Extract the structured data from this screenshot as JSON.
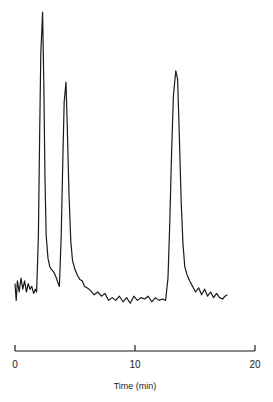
{
  "chart_data": {
    "type": "line",
    "title": "",
    "xlabel": "Time (min)",
    "ylabel": "",
    "xlim": [
      0,
      20
    ],
    "xticks": [
      0,
      10,
      20
    ],
    "grid": false,
    "legend": null,
    "line_color": "#1a1a1a",
    "peaks": [
      {
        "time": 2.3,
        "relative_height": 1.0
      },
      {
        "time": 4.25,
        "relative_height": 0.75
      },
      {
        "time": 13.5,
        "relative_height": 0.79
      }
    ],
    "trace": [
      [
        0.0,
        0.03
      ],
      [
        0.1,
        -0.03
      ],
      [
        0.2,
        0.04
      ],
      [
        0.35,
        0.0
      ],
      [
        0.5,
        0.05
      ],
      [
        0.65,
        0.01
      ],
      [
        0.8,
        0.04
      ],
      [
        0.95,
        0.0
      ],
      [
        1.1,
        0.03
      ],
      [
        1.25,
        0.01
      ],
      [
        1.4,
        0.02
      ],
      [
        1.55,
        -0.005
      ],
      [
        1.7,
        0.01
      ],
      [
        1.8,
        0.0
      ],
      [
        1.95,
        0.2
      ],
      [
        2.05,
        0.55
      ],
      [
        2.15,
        0.85
      ],
      [
        2.3,
        1.0
      ],
      [
        2.4,
        0.75
      ],
      [
        2.5,
        0.4
      ],
      [
        2.6,
        0.2
      ],
      [
        2.75,
        0.12
      ],
      [
        2.9,
        0.09
      ],
      [
        3.05,
        0.08
      ],
      [
        3.25,
        0.07
      ],
      [
        3.45,
        0.05
      ],
      [
        3.6,
        0.03
      ],
      [
        3.7,
        0.02
      ],
      [
        3.85,
        0.2
      ],
      [
        4.0,
        0.5
      ],
      [
        4.1,
        0.68
      ],
      [
        4.25,
        0.75
      ],
      [
        4.35,
        0.6
      ],
      [
        4.5,
        0.35
      ],
      [
        4.65,
        0.18
      ],
      [
        4.8,
        0.11
      ],
      [
        5.0,
        0.08
      ],
      [
        5.2,
        0.06
      ],
      [
        5.4,
        0.045
      ],
      [
        5.6,
        0.04
      ],
      [
        5.8,
        0.02
      ],
      [
        6.0,
        0.015
      ],
      [
        6.3,
        0.005
      ],
      [
        6.6,
        -0.01
      ],
      [
        6.9,
        0.0
      ],
      [
        7.2,
        -0.015
      ],
      [
        7.5,
        -0.005
      ],
      [
        7.8,
        -0.03
      ],
      [
        8.1,
        -0.02
      ],
      [
        8.4,
        -0.03
      ],
      [
        8.7,
        -0.015
      ],
      [
        9.0,
        -0.035
      ],
      [
        9.3,
        -0.02
      ],
      [
        9.6,
        -0.04
      ],
      [
        9.9,
        -0.015
      ],
      [
        10.2,
        -0.03
      ],
      [
        10.5,
        -0.02
      ],
      [
        10.8,
        -0.025
      ],
      [
        11.1,
        -0.015
      ],
      [
        11.4,
        -0.035
      ],
      [
        11.7,
        -0.02
      ],
      [
        12.0,
        -0.03
      ],
      [
        12.3,
        -0.025
      ],
      [
        12.55,
        -0.03
      ],
      [
        12.75,
        0.05
      ],
      [
        12.9,
        0.25
      ],
      [
        13.05,
        0.5
      ],
      [
        13.2,
        0.7
      ],
      [
        13.4,
        0.79
      ],
      [
        13.55,
        0.76
      ],
      [
        13.7,
        0.55
      ],
      [
        13.85,
        0.32
      ],
      [
        14.0,
        0.17
      ],
      [
        14.15,
        0.09
      ],
      [
        14.35,
        0.06
      ],
      [
        14.55,
        0.04
      ],
      [
        14.8,
        0.02
      ],
      [
        15.05,
        0.0
      ],
      [
        15.3,
        0.015
      ],
      [
        15.55,
        -0.01
      ],
      [
        15.8,
        0.01
      ],
      [
        16.05,
        -0.015
      ],
      [
        16.3,
        0.0
      ],
      [
        16.55,
        -0.02
      ],
      [
        16.8,
        -0.005
      ],
      [
        17.05,
        -0.02
      ],
      [
        17.3,
        -0.025
      ],
      [
        17.5,
        -0.015
      ],
      [
        17.7,
        -0.01
      ]
    ]
  }
}
